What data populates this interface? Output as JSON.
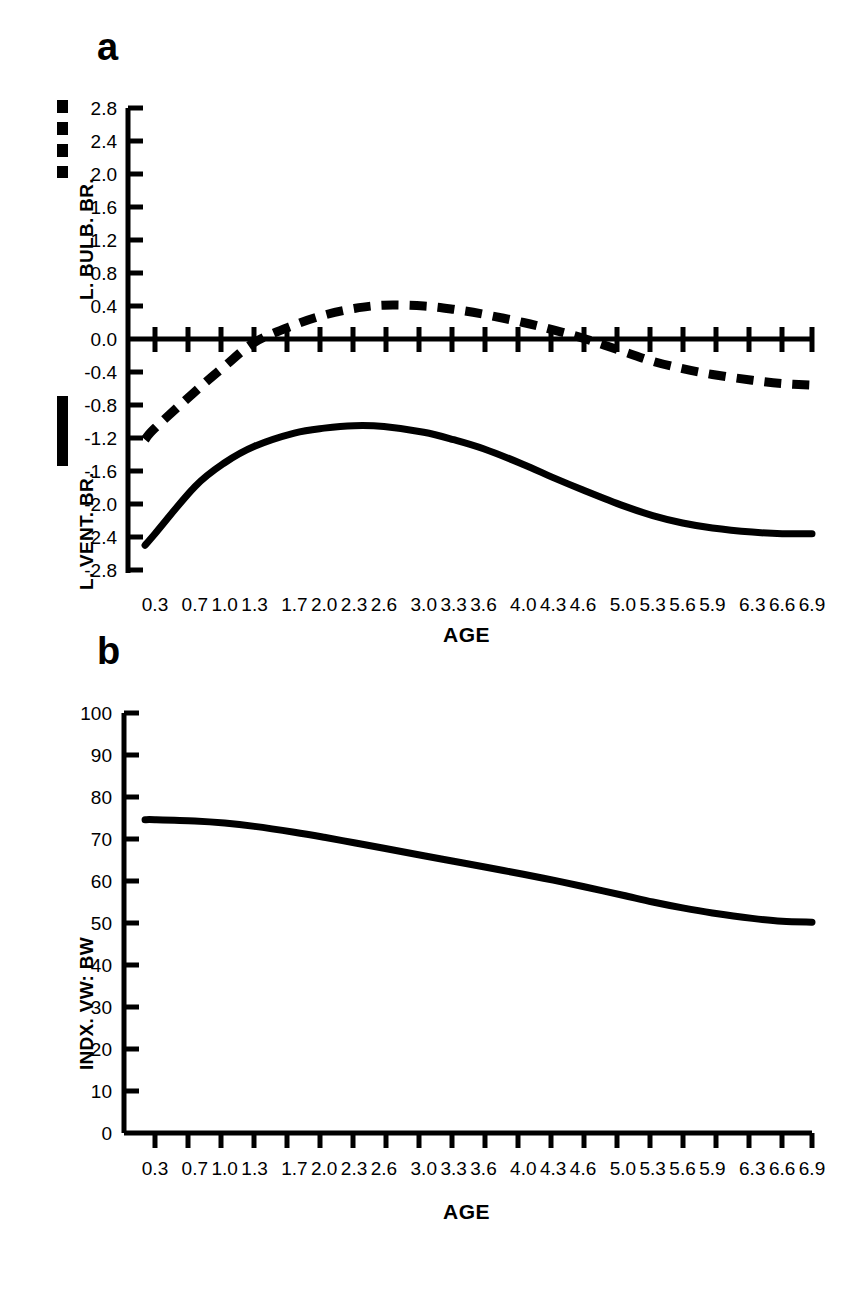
{
  "figure": {
    "panels": [
      {
        "letter": "a",
        "ylabels": [
          {
            "text": "L. BULB. BR.",
            "legend": "dashed"
          },
          {
            "text": "L. VENT. BR.",
            "legend": "solid"
          }
        ],
        "xlabel": "AGE",
        "yticks": [
          "2.8",
          "2.4",
          "2.0",
          "1.6",
          "1.2",
          "0.8",
          "0.4",
          "0.0",
          "-0.4",
          "-0.8",
          "-1.2",
          "-1.6",
          "-2.0",
          "-2.4",
          "-2.8"
        ],
        "xticks": [
          "0.3",
          "0.7",
          "1.0",
          "1.3",
          "1.7",
          "2.0",
          "2.3",
          "2.6",
          "3.0",
          "3.3",
          "3.6",
          "4.0",
          "4.3",
          "4.6",
          "5.0",
          "5.3",
          "5.6",
          "5.9",
          "6.3",
          "6.6",
          "6.9"
        ]
      },
      {
        "letter": "b",
        "ylabels": [
          {
            "text": "INDX. VW: BW",
            "legend": "none"
          }
        ],
        "xlabel": "AGE",
        "yticks": [
          "100",
          "90",
          "80",
          "70",
          "60",
          "50",
          "40",
          "30",
          "20",
          "10",
          "0"
        ],
        "xticks": [
          "0.3",
          "0.7",
          "1.0",
          "1.3",
          "1.7",
          "2.0",
          "2.3",
          "2.6",
          "3.0",
          "3.3",
          "3.6",
          "4.0",
          "4.3",
          "4.6",
          "5.0",
          "5.3",
          "5.6",
          "5.9",
          "6.3",
          "6.6",
          "6.9"
        ]
      }
    ]
  },
  "chart_data": [
    {
      "type": "line",
      "title": "a",
      "xlabel": "AGE",
      "ylabel": "L. BULB. BR. / L. VENT. BR.",
      "xlim": [
        0.15,
        7.05
      ],
      "ylim": [
        -2.8,
        2.8
      ],
      "ytick_values": [
        2.8,
        2.4,
        2.0,
        1.6,
        1.2,
        0.8,
        0.4,
        0.0,
        -0.4,
        -0.8,
        -1.2,
        -1.6,
        -2.0,
        -2.4,
        -2.8
      ],
      "xtick_values": [
        0.3,
        0.7,
        1.0,
        1.3,
        1.7,
        2.0,
        2.3,
        2.6,
        3.0,
        3.3,
        3.6,
        4.0,
        4.3,
        4.6,
        5.0,
        5.3,
        5.6,
        5.9,
        6.3,
        6.6,
        6.9
      ],
      "grid": false,
      "legend_position": "left-axis",
      "series": [
        {
          "name": "L. BULB. BR.",
          "style": "dashed",
          "x": [
            0.2,
            0.3,
            0.7,
            1.0,
            1.3,
            1.7,
            2.0,
            2.3,
            2.6,
            3.0,
            3.3,
            3.6,
            4.0,
            4.3,
            4.6,
            5.0,
            5.3,
            5.6,
            5.9,
            6.3,
            6.6,
            6.9
          ],
          "values": [
            -1.22,
            -1.08,
            -0.64,
            -0.33,
            -0.04,
            0.17,
            0.29,
            0.37,
            0.41,
            0.4,
            0.36,
            0.3,
            0.2,
            0.11,
            0.01,
            -0.15,
            -0.27,
            -0.36,
            -0.43,
            -0.5,
            -0.54,
            -0.56
          ]
        },
        {
          "name": "L. VENT. BR.",
          "style": "solid",
          "x": [
            0.2,
            0.3,
            0.7,
            1.0,
            1.3,
            1.7,
            2.0,
            2.3,
            2.6,
            3.0,
            3.3,
            3.6,
            4.0,
            4.3,
            4.6,
            5.0,
            5.3,
            5.6,
            5.9,
            6.3,
            6.6,
            6.9
          ],
          "values": [
            -2.5,
            -2.36,
            -1.79,
            -1.5,
            -1.3,
            -1.14,
            -1.08,
            -1.05,
            -1.06,
            -1.13,
            -1.22,
            -1.33,
            -1.52,
            -1.68,
            -1.83,
            -2.02,
            -2.14,
            -2.23,
            -2.29,
            -2.34,
            -2.36,
            -2.36
          ]
        }
      ]
    },
    {
      "type": "line",
      "title": "b",
      "xlabel": "AGE",
      "ylabel": "INDX. VW: BW",
      "xlim": [
        0.15,
        7.05
      ],
      "ylim": [
        0,
        100
      ],
      "ytick_values": [
        100,
        90,
        80,
        70,
        60,
        50,
        40,
        30,
        20,
        10,
        0
      ],
      "xtick_values": [
        0.3,
        0.7,
        1.0,
        1.3,
        1.7,
        2.0,
        2.3,
        2.6,
        3.0,
        3.3,
        3.6,
        4.0,
        4.3,
        4.6,
        5.0,
        5.3,
        5.6,
        5.9,
        6.3,
        6.6,
        6.9
      ],
      "grid": false,
      "legend_position": "none",
      "series": [
        {
          "name": "INDX. VW: BW",
          "style": "solid",
          "x": [
            0.2,
            0.3,
            0.7,
            1.0,
            1.3,
            1.7,
            2.0,
            2.3,
            2.6,
            3.0,
            3.3,
            3.6,
            4.0,
            4.3,
            4.6,
            5.0,
            5.3,
            5.6,
            5.9,
            6.3,
            6.6,
            6.9
          ],
          "values": [
            74.6,
            74.6,
            74.3,
            73.8,
            73.0,
            71.6,
            70.4,
            69.1,
            67.8,
            66.0,
            64.7,
            63.4,
            61.6,
            60.2,
            58.7,
            56.6,
            55.0,
            53.6,
            52.4,
            51.1,
            50.4,
            50.2
          ]
        }
      ]
    }
  ]
}
